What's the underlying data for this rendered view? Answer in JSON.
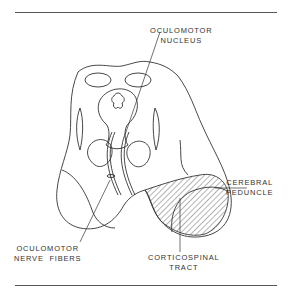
{
  "figure": {
    "labels": {
      "oculomotor_nucleus": [
        "OCULOMOTOR",
        "NUCLEUS"
      ],
      "cerebral_peduncle": [
        "CEREBRAL",
        "PEDUNCLE"
      ],
      "oculomotor_nerve_fibers": [
        "OCULOMOTOR",
        "NERVE  FIBERS"
      ],
      "corticospinal_tract": [
        "CORTICOSPINAL",
        "TRACT"
      ]
    },
    "colors": {
      "line": "#333333",
      "rule": "#555555",
      "background": "#ffffff"
    }
  }
}
